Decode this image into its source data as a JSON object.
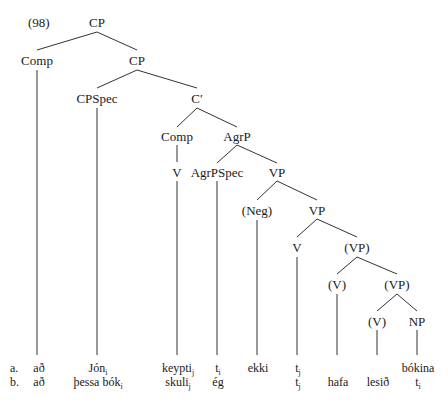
{
  "example_number": "(98)",
  "nodes": {
    "cp_root": "CP",
    "comp_top": "Comp",
    "cp_inner": "CP",
    "cpspec": "CPSpec",
    "c_bar": "C′",
    "comp_mid": "Comp",
    "agrp": "AgrP",
    "v_under_comp": "V",
    "agrpspec": "AgrPSpec",
    "vp1": "VP",
    "neg": "(Neg)",
    "vp2": "VP",
    "v2": "V",
    "vp3": "(VP)",
    "v3": "(V)",
    "vp4": "(VP)",
    "v4": "(V)",
    "np": "NP"
  },
  "rows": {
    "a": {
      "label": "a.",
      "words": [
        {
          "text": "að",
          "sub": ""
        },
        {
          "text": "Jón",
          "sub": "i"
        },
        {
          "text": "keypti",
          "sub": "j"
        },
        {
          "text": "t",
          "sub": "i"
        },
        {
          "text": "ekki",
          "sub": ""
        },
        {
          "text": "t",
          "sub": "j"
        },
        {
          "text": "",
          "sub": ""
        },
        {
          "text": "",
          "sub": ""
        },
        {
          "text": "bókina",
          "sub": ""
        }
      ]
    },
    "b": {
      "label": "b.",
      "words": [
        {
          "text": "að",
          "sub": ""
        },
        {
          "text": "þessa bók",
          "sub": "i"
        },
        {
          "text": "skuli",
          "sub": "j"
        },
        {
          "text": "ég",
          "sub": ""
        },
        {
          "text": "",
          "sub": ""
        },
        {
          "text": "t",
          "sub": "j"
        },
        {
          "text": "hafa",
          "sub": ""
        },
        {
          "text": "lesið",
          "sub": ""
        },
        {
          "text": "t",
          "sub": "i"
        }
      ]
    }
  }
}
